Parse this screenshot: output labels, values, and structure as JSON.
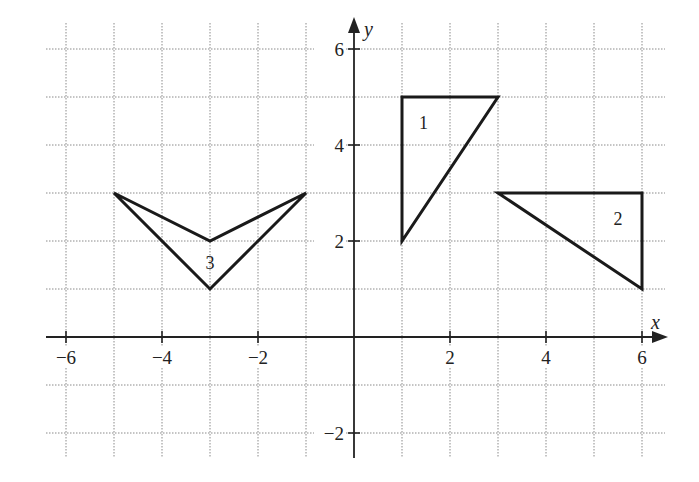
{
  "axes": {
    "x_label": "x",
    "y_label": "y",
    "x_ticks": [
      {
        "value": -6,
        "label": "−6"
      },
      {
        "value": -4,
        "label": "−4"
      },
      {
        "value": -2,
        "label": "−2"
      },
      {
        "value": 2,
        "label": "2"
      },
      {
        "value": 4,
        "label": "4"
      },
      {
        "value": 6,
        "label": "6"
      }
    ],
    "y_ticks": [
      {
        "value": 6,
        "label": "6"
      },
      {
        "value": 4,
        "label": "4"
      },
      {
        "value": 2,
        "label": "2"
      },
      {
        "value": -2,
        "label": "−2"
      }
    ]
  },
  "shapes": [
    {
      "label": "1",
      "points": [
        [
          1,
          2
        ],
        [
          1,
          5
        ],
        [
          3,
          5
        ]
      ],
      "label_pos": [
        1.45,
        4.45
      ]
    },
    {
      "label": "2",
      "points": [
        [
          3,
          3
        ],
        [
          6,
          3
        ],
        [
          6,
          1
        ]
      ],
      "label_pos": [
        5.5,
        2.45
      ]
    },
    {
      "label": "3",
      "points": [
        [
          -5,
          3
        ],
        [
          -3,
          1
        ],
        [
          -1,
          3
        ],
        [
          -3,
          2
        ]
      ],
      "label_pos": [
        -3,
        1.55
      ]
    }
  ],
  "chart_data": {
    "type": "scatter",
    "title": "",
    "xlabel": "x",
    "ylabel": "y",
    "xlim": [
      -6.5,
      6.5
    ],
    "ylim": [
      -2.5,
      6.5
    ],
    "grid": true,
    "series": [
      {
        "name": "1",
        "shape": "triangle",
        "x": [
          1,
          1,
          3
        ],
        "y": [
          2,
          5,
          5
        ]
      },
      {
        "name": "2",
        "shape": "triangle",
        "x": [
          3,
          6,
          6
        ],
        "y": [
          3,
          3,
          1
        ]
      },
      {
        "name": "3",
        "shape": "quadrilateral (concave V)",
        "x": [
          -5,
          -3,
          -1,
          -3
        ],
        "y": [
          3,
          1,
          3,
          2
        ]
      }
    ]
  }
}
